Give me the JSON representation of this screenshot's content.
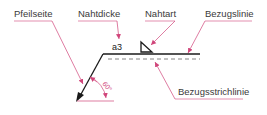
{
  "labels": {
    "arrow_side": "Pfeilseite",
    "weld_thickness": "Nahtdicke",
    "weld_type": "Nahtart",
    "reference_line": "Bezugslinie",
    "dashed_reference_line": "Bezugsstrichlinie"
  },
  "weld_symbol": {
    "thickness_value": "a3",
    "type_symbol": "fillet-triangle"
  },
  "angle": {
    "value": "60°"
  },
  "colors": {
    "line": "#1a1a1a",
    "leader": "#d0457a",
    "text": "#3a3a3a"
  }
}
